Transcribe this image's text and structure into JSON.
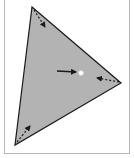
{
  "diagram": {
    "type": "triangle-with-vertex-arrows",
    "colors": {
      "fill": "#b3b3b3",
      "stroke": "#1a1a1a",
      "frame": "#b8b8b8",
      "point_fill": "#ffffff",
      "background": "#ffffff"
    },
    "triangle": {
      "vertices": [
        [
          32,
          7
        ],
        [
          121,
          83
        ],
        [
          15,
          145
        ]
      ]
    },
    "vertex_arrows": [
      {
        "name": "top-vertex",
        "from": [
          34,
          10
        ],
        "to": [
          45,
          27
        ]
      },
      {
        "name": "right-vertex",
        "from": [
          119,
          82
        ],
        "to": [
          97,
          78
        ]
      },
      {
        "name": "bottom-vertex",
        "from": [
          17,
          142
        ],
        "to": [
          30,
          126
        ]
      }
    ],
    "pointer_arrow": {
      "from": [
        57,
        71
      ],
      "to": [
        76,
        72
      ]
    },
    "point": {
      "center": [
        81,
        73
      ],
      "radius": 2.5
    }
  }
}
